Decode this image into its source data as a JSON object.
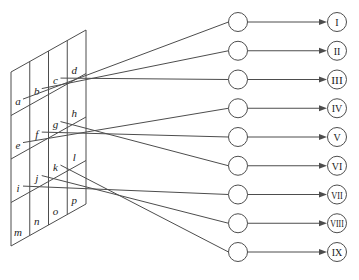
{
  "diagram": {
    "grid": {
      "rows": 4,
      "cols": 4,
      "cell_labels": [
        [
          "a",
          "b",
          "c",
          "d"
        ],
        [
          "e",
          "f",
          "g",
          "h"
        ],
        [
          "i",
          "j",
          "k",
          "l"
        ],
        [
          "m",
          "n",
          "o",
          "p"
        ]
      ]
    },
    "units": [
      {
        "label": "I"
      },
      {
        "label": "II"
      },
      {
        "label": "III"
      },
      {
        "label": "IV"
      },
      {
        "label": "V"
      },
      {
        "label": "VI"
      },
      {
        "label": "VII"
      },
      {
        "label": "VIII"
      },
      {
        "label": "IX"
      }
    ],
    "connections": [
      {
        "from": "a",
        "to": "I"
      },
      {
        "from": "b",
        "to": "II"
      },
      {
        "from": "c",
        "to": "III"
      },
      {
        "from": "e",
        "to": "IV"
      },
      {
        "from": "f",
        "to": "V"
      },
      {
        "from": "g",
        "to": "VI"
      },
      {
        "from": "i",
        "to": "VII"
      },
      {
        "from": "j",
        "to": "VIII"
      },
      {
        "from": "k",
        "to": "IX"
      }
    ],
    "colors": {
      "line": "#4d4d4d",
      "text": "#1c1c1c",
      "background": "#ffffff",
      "node_fill": "#ffffff",
      "node_stroke": "#4d4d4d"
    }
  }
}
